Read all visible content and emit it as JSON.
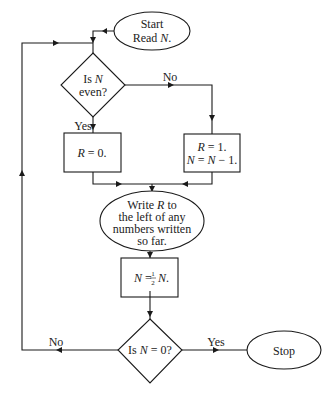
{
  "flowchart": {
    "start": {
      "line1": "Start",
      "line2_prefix": "Read ",
      "line2_var": "N",
      "line2_suffix": "."
    },
    "decision_even": {
      "line1_prefix": "Is ",
      "line1_var": "N",
      "line2": "even?"
    },
    "branch_labels": {
      "even_yes": "Yes",
      "even_no": "No",
      "zero_yes": "Yes",
      "zero_no": "No"
    },
    "box_r0": {
      "var": "R",
      "text": " = 0."
    },
    "box_r1": {
      "line1_var": "R",
      "line1_text": " = 1.",
      "line2_var1": "N",
      "line2_eq": " = ",
      "line2_var2": "N",
      "line2_text": " − 1."
    },
    "write_step": {
      "line1_prefix": "Write ",
      "line1_var": "R",
      "line1_suffix": "  to",
      "line2": "the left of any",
      "line3": "numbers written",
      "line4": "so far."
    },
    "halve_box": {
      "var1": "N",
      "eq": " = ",
      "num": "1",
      "den": "2",
      "var2": "N",
      "suffix": "."
    },
    "decision_zero": {
      "prefix": "Is ",
      "var": "N",
      "suffix": " = 0?"
    },
    "stop": {
      "label": "Stop"
    },
    "colors": {
      "stroke": "#1a1a1a",
      "background": "#ffffff",
      "text": "#222222"
    }
  }
}
